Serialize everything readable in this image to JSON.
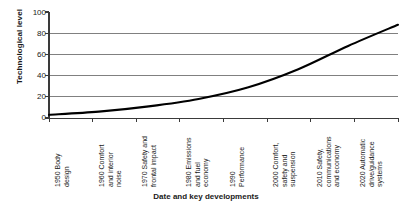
{
  "chart_data": {
    "type": "line",
    "title": "",
    "xlabel": "Date and key developments",
    "ylabel": "Technological level",
    "ylim": [
      0,
      100
    ],
    "yticks": [
      0,
      20,
      40,
      60,
      80,
      100
    ],
    "grid": true,
    "legend": "none",
    "line_color": "#000000",
    "grid_color": "#808080",
    "axis_color": "#3a3a3a",
    "categories": [
      "1950 Body design",
      "1960 Comfort and interior noise",
      "1970 Safety and frontal impact",
      "1980 Emissions and fuel economy",
      "1990 Performance",
      "2000 Comfort, safety and suspension",
      "2010 Safety, communications and economy",
      "2020 Automatic drive/guidance systems"
    ],
    "x": [
      1950,
      1960,
      1970,
      1980,
      1990,
      2000,
      2010,
      2020
    ],
    "values": [
      3,
      6,
      11,
      18,
      29,
      46,
      68,
      88
    ],
    "series": [
      {
        "name": "Technological level",
        "values": [
          3,
          6,
          11,
          18,
          29,
          46,
          68,
          88
        ]
      }
    ]
  },
  "axes": {
    "y_title": "Technological level",
    "x_title": "Date and key developments",
    "y_tick_labels": [
      "100",
      "80",
      "60",
      "40",
      "20",
      "0"
    ]
  },
  "x_labels": [
    {
      "lines": [
        "1950 Body",
        "design"
      ]
    },
    {
      "lines": [
        "1960 Comfort",
        "and interior",
        "noise"
      ]
    },
    {
      "lines": [
        "1970 Safety and",
        "frontal impact"
      ]
    },
    {
      "lines": [
        "1980 Emissions",
        "and fuel",
        "economy"
      ]
    },
    {
      "lines": [
        "1990",
        "Performance"
      ]
    },
    {
      "lines": [
        "2000 Comfort,",
        "safety and",
        "suspension"
      ]
    },
    {
      "lines": [
        "2010 Safety,",
        "communications",
        "and economy"
      ]
    },
    {
      "lines": [
        "2020 Automatic",
        "drive/guidance",
        "systems"
      ]
    }
  ]
}
